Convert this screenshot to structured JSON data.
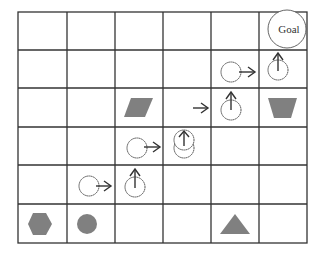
{
  "diagram": {
    "title": "",
    "grid": {
      "columns": 6,
      "rows": 6,
      "left": 18,
      "top": 12,
      "col_lines": [
        18,
        67,
        115,
        163,
        211,
        259,
        307
      ],
      "row_lines": [
        12,
        50,
        88,
        127,
        165,
        204,
        243
      ],
      "line_color": "#333333",
      "background": "#ffffff"
    },
    "goal": {
      "label": "Goal",
      "cell": [
        5,
        0
      ]
    },
    "obstacles": [
      {
        "shape": "parallelogram",
        "cell": [
          2,
          2
        ],
        "color": "#808080"
      },
      {
        "shape": "trapezoid",
        "cell": [
          5,
          2
        ],
        "color": "#808080"
      },
      {
        "shape": "hexagon",
        "cell": [
          0,
          5
        ],
        "color": "#808080"
      },
      {
        "shape": "circle",
        "cell": [
          1,
          5
        ],
        "color": "#808080"
      },
      {
        "shape": "triangle",
        "cell": [
          4,
          5
        ],
        "color": "#808080"
      }
    ],
    "path_steps": [
      {
        "cell": [
          1,
          4
        ],
        "action": "right"
      },
      {
        "cell": [
          2,
          4
        ],
        "action": "up"
      },
      {
        "cell": [
          2,
          3
        ],
        "action": "right"
      },
      {
        "cell": [
          3,
          3
        ],
        "action": "up"
      },
      {
        "cell": [
          3,
          2
        ],
        "action": "right"
      },
      {
        "cell": [
          4,
          2
        ],
        "action": "up"
      },
      {
        "cell": [
          4,
          1
        ],
        "action": "right"
      },
      {
        "cell": [
          5,
          1
        ],
        "action": "up"
      }
    ]
  }
}
